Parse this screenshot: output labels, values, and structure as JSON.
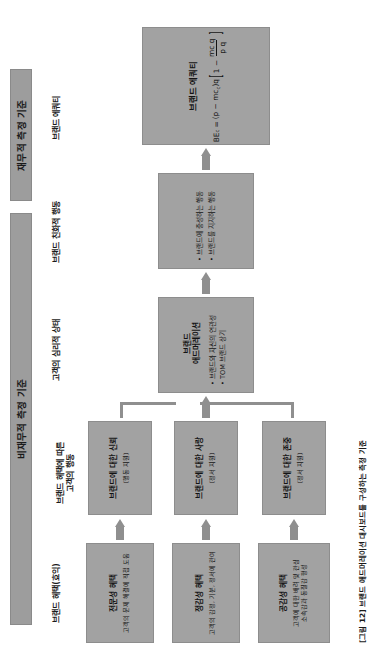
{
  "figure": {
    "caption": "[그림 12] 브랜드 애드머레이션 대시보드를 구성하는 측정 기준"
  },
  "bands": {
    "nonfinancial": "비재무적 측정 기준",
    "financial": "재무적 측정 기준"
  },
  "column_labels": {
    "benefits": "브랜드 혜택(효익)",
    "customer_behavior": "브랜드 혜택에 따른\n고객의 행동",
    "psych_state": "고객의 심리적 상태",
    "brand_friendly": "브랜드 친화적 행동",
    "brand_equity": "브랜드 에쿼티"
  },
  "boxes": {
    "benefit_enabling": {
      "title": "전문성 혜택",
      "sub": "고객의 문제 해결에 직접 도움"
    },
    "benefit_enticing": {
      "title": "정감성 혜택",
      "sub": "고객의 감정, 기분, 정서에 관여"
    },
    "benefit_enriching": {
      "title": "공감성 혜택",
      "sub": "고객에 대한 배려 및 관심\n소속감과 동질감 형성"
    },
    "trust": {
      "title": "브랜드에 대한 신뢰",
      "sub": "(행동 지원)"
    },
    "love": {
      "title": "브랜드에 대한 사랑",
      "sub": "(정서 지원)"
    },
    "respect": {
      "title": "브랜드에 대한 존중",
      "sub": "(정서 지원)"
    },
    "admiration": {
      "title": "브랜드\n애드머레이션",
      "bullets": [
        "브랜드와 자신의 연관성",
        "TOM 브랜드 상기"
      ]
    },
    "behavior": {
      "bullets": [
        "브랜드에 충성하는 행동",
        "브랜드를 지지하는 행동"
      ]
    },
    "equity": {
      "title": "브랜드 에쿼티",
      "formula": {
        "lhs": "BE",
        "lhs_sub": "c",
        "equals": "=",
        "group": "(p − mc)q",
        "group_p": "p",
        "group_mc": "mc",
        "group_mc_sub": "c",
        "group_q": "q",
        "bracket_left": "[",
        "one_minus": "1 −",
        "frac_num": "mc q",
        "frac_num_sub": "c",
        "frac_den": "p q",
        "bracket_right": "]"
      }
    }
  },
  "colors": {
    "box_fill": "#a2a2a2",
    "band_fill": "#9d9d9d",
    "arrow": "#8f8f8f",
    "text": "#141414",
    "page_bg": "#ffffff"
  }
}
